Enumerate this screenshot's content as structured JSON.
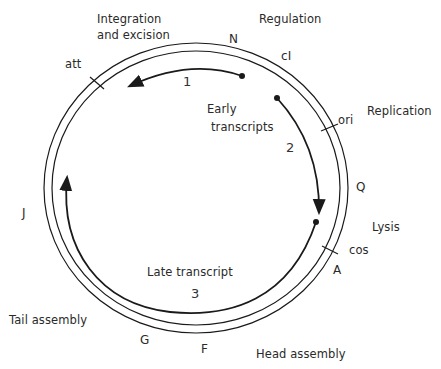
{
  "figure": {
    "function_labels": {
      "integration": [
        "Integration",
        "and excision"
      ],
      "regulation": "Regulation",
      "replication": "Replication",
      "lysis": "Lysis",
      "head_assembly": "Head assembly",
      "tail_assembly": "Tail assembly"
    },
    "gene_labels": {
      "N": "N",
      "cI": "cI",
      "Q": "Q",
      "A": "A",
      "F": "F",
      "G": "G",
      "J": "J"
    },
    "site_labels": {
      "att": "att",
      "ori": "ori",
      "cos": "cos"
    },
    "transcripts": {
      "early_label": [
        "Early",
        "transcripts"
      ],
      "late_label": "Late transcript",
      "numbers": [
        "1",
        "2",
        "3"
      ]
    },
    "colors": {
      "line": "#1a1a1a",
      "text": "#2a2a2a",
      "background": "#ffffff"
    }
  }
}
